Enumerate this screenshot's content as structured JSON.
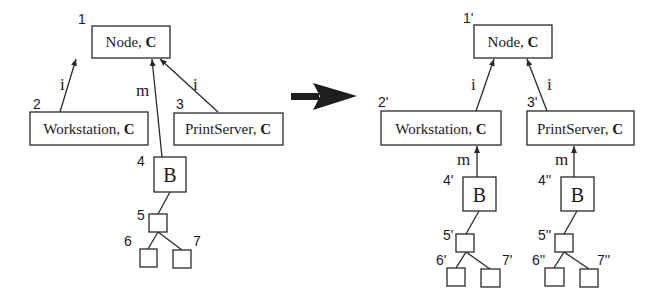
{
  "left_tree": {
    "nodes": [
      {
        "id": "1",
        "name": "Node",
        "suffix": "C"
      },
      {
        "id": "2",
        "name": "Workstation",
        "suffix": "C"
      },
      {
        "id": "3",
        "name": "PrintServer",
        "suffix": "C"
      },
      {
        "id": "4",
        "name": "B",
        "suffix": ""
      },
      {
        "id": "5",
        "name": "",
        "suffix": ""
      },
      {
        "id": "6",
        "name": "",
        "suffix": ""
      },
      {
        "id": "7",
        "name": "",
        "suffix": ""
      }
    ],
    "edges": [
      {
        "from": "2",
        "to": "1",
        "label": "i"
      },
      {
        "from": "4",
        "to": "1",
        "label": "m"
      },
      {
        "from": "3",
        "to": "1",
        "label": "i"
      },
      {
        "from": "5",
        "to": "4",
        "label": ""
      },
      {
        "from": "6",
        "to": "5",
        "label": ""
      },
      {
        "from": "7",
        "to": "5",
        "label": ""
      }
    ]
  },
  "transform_arrow": "arrow-right",
  "right_tree": {
    "nodes": [
      {
        "id": "1'",
        "name": "Node",
        "suffix": "C"
      },
      {
        "id": "2'",
        "name": "Workstation",
        "suffix": "C"
      },
      {
        "id": "3'",
        "name": "PrintServer",
        "suffix": "C"
      },
      {
        "id": "4'",
        "name": "B",
        "suffix": ""
      },
      {
        "id": "4''",
        "name": "B",
        "suffix": ""
      },
      {
        "id": "5'",
        "name": "",
        "suffix": ""
      },
      {
        "id": "5''",
        "name": "",
        "suffix": ""
      },
      {
        "id": "6'",
        "name": "",
        "suffix": ""
      },
      {
        "id": "7'",
        "name": "",
        "suffix": ""
      },
      {
        "id": "6''",
        "name": "",
        "suffix": ""
      },
      {
        "id": "7''",
        "name": "",
        "suffix": ""
      }
    ],
    "edges": [
      {
        "from": "2'",
        "to": "1'",
        "label": "i"
      },
      {
        "from": "3'",
        "to": "1'",
        "label": "i"
      },
      {
        "from": "4'",
        "to": "2'",
        "label": "m"
      },
      {
        "from": "4''",
        "to": "3'",
        "label": "m"
      },
      {
        "from": "5'",
        "to": "4'",
        "label": ""
      },
      {
        "from": "6'",
        "to": "5'",
        "label": ""
      },
      {
        "from": "7'",
        "to": "5'",
        "label": ""
      },
      {
        "from": "5''",
        "to": "4''",
        "label": ""
      },
      {
        "from": "6''",
        "to": "5''",
        "label": ""
      },
      {
        "from": "7''",
        "to": "5''",
        "label": ""
      }
    ]
  },
  "separator": ", "
}
